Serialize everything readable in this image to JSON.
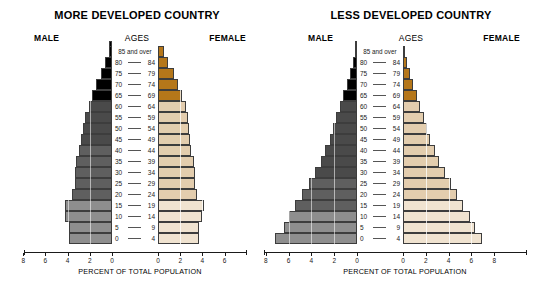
{
  "charts": [
    {
      "id": "more-developed-country",
      "title": "MORE DEVELOPED COUNTRY",
      "male_label": "MALE",
      "female_label": "FEMALE",
      "ages_label": "AGES",
      "axis_caption": "PERCENT OF TOTAL POPULATION",
      "male_ticks": [
        "8",
        "6",
        "4",
        "2",
        "0"
      ],
      "female_ticks": [
        "0",
        "2",
        "4",
        "6"
      ]
    },
    {
      "id": "less-developed-country",
      "title": "LESS DEVELOPED COUNTRY",
      "male_label": "MALE",
      "female_label": "FEMALE",
      "ages_label": "AGES",
      "axis_caption": "PERCENT OF TOTAL POPULATION",
      "male_ticks": [
        "8",
        "6",
        "4",
        "2",
        "0"
      ],
      "female_ticks": [
        "0",
        "2",
        "4",
        "6",
        "8"
      ]
    }
  ],
  "age_groups": [
    {
      "label": "85 and over",
      "lo": "85",
      "hi": "",
      "single": true
    },
    {
      "label": "80 — 84",
      "lo": "80",
      "hi": "84",
      "single": false
    },
    {
      "label": "75 — 79",
      "lo": "75",
      "hi": "79",
      "single": false
    },
    {
      "label": "70 — 74",
      "lo": "70",
      "hi": "74",
      "single": false
    },
    {
      "label": "65 — 69",
      "lo": "65",
      "hi": "69",
      "single": false
    },
    {
      "label": "60 — 64",
      "lo": "60",
      "hi": "64",
      "single": false
    },
    {
      "label": "55 — 59",
      "lo": "55",
      "hi": "59",
      "single": false
    },
    {
      "label": "50 — 54",
      "lo": "50",
      "hi": "54",
      "single": false
    },
    {
      "label": "45 — 49",
      "lo": "45",
      "hi": "49",
      "single": false
    },
    {
      "label": "40 — 44",
      "lo": "40",
      "hi": "44",
      "single": false
    },
    {
      "label": "35 — 39",
      "lo": "35",
      "hi": "39",
      "single": false
    },
    {
      "label": "30 — 34",
      "lo": "30",
      "hi": "34",
      "single": false
    },
    {
      "label": "25 — 29",
      "lo": "25",
      "hi": "29",
      "single": false
    },
    {
      "label": "20 — 24",
      "lo": "20",
      "hi": "24",
      "single": false
    },
    {
      "label": "15 — 19",
      "lo": "15",
      "hi": "19",
      "single": false
    },
    {
      "label": "10 — 14",
      "lo": "10",
      "hi": "14",
      "single": false
    },
    {
      "label": "5 — 9",
      "lo": "5",
      "hi": "9",
      "single": false
    },
    {
      "label": "0 — 4",
      "lo": "0",
      "hi": "4",
      "single": false
    }
  ],
  "colors": {
    "male_elderly": "#000000",
    "male_adult": "#4a4a4a",
    "male_mid": "#5f5f5f",
    "male_young": "#8e8e8e",
    "female_elderly": "#b5771a",
    "female_adult": "#e3cdae",
    "female_young": "#f0e3d0",
    "outline": "#3d3d3d",
    "text": "#000000"
  },
  "chart_data": [
    {
      "type": "bar",
      "orientation": "population-pyramid",
      "title": "MORE DEVELOPED COUNTRY",
      "xlabel": "PERCENT OF TOTAL POPULATION",
      "ylabel": "AGES",
      "categories": [
        "0 — 4",
        "5 — 9",
        "10 — 14",
        "15 — 19",
        "20 — 24",
        "25 — 29",
        "30 — 34",
        "35 — 39",
        "40 — 44",
        "45 — 49",
        "50 — 54",
        "55 — 59",
        "60 — 64",
        "65 — 69",
        "70 — 74",
        "75 — 79",
        "80 — 84",
        "85 and over"
      ],
      "series": [
        {
          "name": "MALE",
          "values": [
            3.9,
            3.9,
            4.2,
            4.2,
            3.6,
            3.3,
            3.3,
            3.2,
            3.0,
            2.8,
            2.6,
            2.4,
            2.1,
            1.8,
            1.4,
            1.0,
            0.6,
            0.3
          ]
        },
        {
          "name": "FEMALE",
          "values": [
            3.7,
            3.7,
            4.0,
            4.1,
            3.5,
            3.3,
            3.3,
            3.2,
            3.0,
            2.9,
            2.8,
            2.7,
            2.5,
            2.2,
            1.8,
            1.4,
            0.9,
            0.5
          ]
        }
      ],
      "xlim_male": [
        8,
        0
      ],
      "xlim_female": [
        0,
        7
      ],
      "grid": true,
      "legend": "none"
    },
    {
      "type": "bar",
      "orientation": "population-pyramid",
      "title": "LESS DEVELOPED COUNTRY",
      "xlabel": "PERCENT OF TOTAL POPULATION",
      "ylabel": "AGES",
      "categories": [
        "0 — 4",
        "5 — 9",
        "10 — 14",
        "15 — 19",
        "20 — 24",
        "25 — 29",
        "30 — 34",
        "35 — 39",
        "40 — 44",
        "45 — 49",
        "50 — 54",
        "55 — 59",
        "60 — 64",
        "65 — 69",
        "70 — 74",
        "75 — 79",
        "80 — 84",
        "85 and over"
      ],
      "series": [
        {
          "name": "MALE",
          "values": [
            7.2,
            6.4,
            6.0,
            5.4,
            4.8,
            4.2,
            3.7,
            3.2,
            2.8,
            2.4,
            2.1,
            1.8,
            1.5,
            1.2,
            0.9,
            0.6,
            0.35,
            0.2
          ]
        },
        {
          "name": "FEMALE",
          "values": [
            6.9,
            6.3,
            5.9,
            5.3,
            4.7,
            4.2,
            3.7,
            3.2,
            2.8,
            2.4,
            2.1,
            1.8,
            1.5,
            1.2,
            0.9,
            0.6,
            0.35,
            0.2
          ]
        }
      ],
      "xlim_male": [
        8,
        0
      ],
      "xlim_female": [
        0,
        8
      ],
      "grid": true,
      "legend": "none"
    }
  ]
}
